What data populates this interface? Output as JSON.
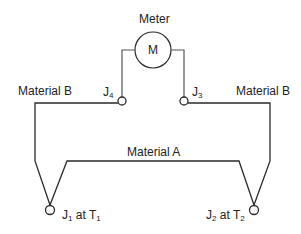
{
  "diagram": {
    "type": "thermocouple-circuit",
    "meter": {
      "title": "Meter",
      "symbol": "M"
    },
    "junctions": [
      {
        "id": "J4",
        "base": "J",
        "sub": "4",
        "suffix": ""
      },
      {
        "id": "J3",
        "base": "J",
        "sub": "3",
        "suffix": ""
      },
      {
        "id": "J1",
        "base": "J",
        "sub": "1",
        "at": " at T",
        "temp_sub": "1"
      },
      {
        "id": "J2",
        "base": "J",
        "sub": "2",
        "at": " at T",
        "temp_sub": "2"
      }
    ],
    "materials": {
      "left": "Material B",
      "right": "Material B",
      "bottom": "Material A"
    },
    "colors": {
      "line": "#2a2a2a",
      "text": "#222222",
      "background": "#ffffff"
    }
  }
}
